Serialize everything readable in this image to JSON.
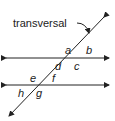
{
  "diagram": {
    "title_label": "transversal",
    "angle_labels": {
      "a": "a",
      "b": "b",
      "c": "c",
      "d": "d",
      "e": "e",
      "f": "f",
      "g": "g",
      "h": "h"
    },
    "colors": {
      "line": "#222222",
      "background": "#ffffff"
    }
  }
}
